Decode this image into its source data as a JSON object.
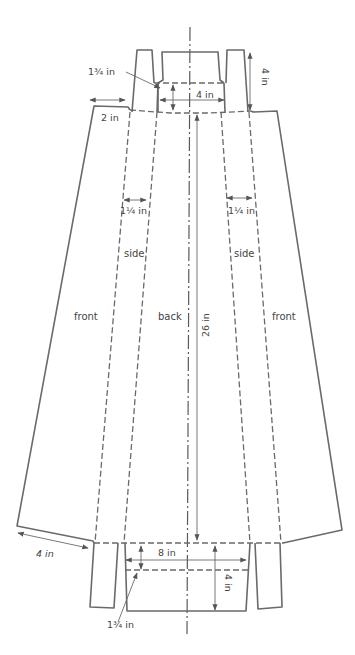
{
  "diagram": {
    "type": "skirt sewing pattern",
    "panels": {
      "front_left": "front",
      "side_left": "side",
      "back": "back",
      "side_right": "side",
      "front_right": "front"
    },
    "measurements": {
      "top_facing_depth": "1¾ in",
      "top_width": "4 in",
      "top_tab_height": "4 in",
      "front_waist_width": "2 in",
      "side_seam_left": "1¼ in",
      "side_seam_right": "1¼ in",
      "length": "26 in",
      "hem_width": "4 in",
      "bottom_width": "8 in",
      "bottom_tab_height": "4 in",
      "bottom_facing_depth": "1¾ in"
    },
    "colors": {
      "line": "#6a6a6a",
      "text": "#444444",
      "background": "#ffffff"
    }
  }
}
